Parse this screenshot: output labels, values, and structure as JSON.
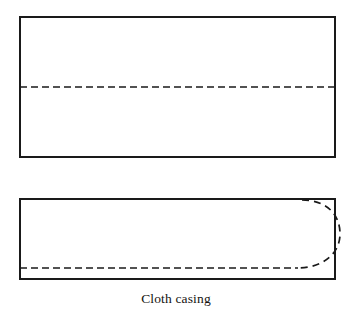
{
  "figure": {
    "caption": "Cloth casing",
    "background_color": "#ffffff",
    "stroke_color": "#1a1a1a",
    "dash_color": "#1a1a1a",
    "canvas": {
      "width": 352,
      "height": 314
    },
    "shapes": [
      {
        "name": "cloth-casing-flat-panel",
        "type": "rectangle",
        "x": 20,
        "y": 17,
        "width": 315,
        "height": 140,
        "stroke_width": 2,
        "fill": "none",
        "fold_line": {
          "name": "center-fold-dashed-line",
          "type": "horizontal-dashed",
          "y": 87,
          "x_start": 20,
          "x_end": 335,
          "dash": "7 4",
          "stroke_width": 1.6
        }
      },
      {
        "name": "cloth-casing-folded-panel",
        "type": "rectangle",
        "x": 20,
        "y": 199,
        "width": 315,
        "height": 80,
        "stroke_width": 2,
        "fill": "none",
        "seam_line": {
          "name": "bottom-seam-dashed-line",
          "type": "horizontal-dashed",
          "y": 268,
          "x_start": 20,
          "x_end": 297,
          "dash": "7 4",
          "stroke_width": 1.6
        },
        "rounded_end": {
          "name": "rounded-end-dashed-arc",
          "type": "dashed-arc",
          "start_x": 302,
          "start_y": 200,
          "end_x": 296,
          "end_y": 268,
          "bulge_x": 339,
          "dash": "7 5",
          "stroke_width": 1.6
        }
      }
    ]
  }
}
